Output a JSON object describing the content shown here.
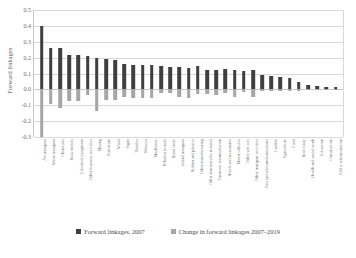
{
  "chart_data": {
    "type": "bar",
    "title": "",
    "xlabel": "",
    "ylabel": "Forward linkages",
    "ylim": [
      -0.3,
      0.5
    ],
    "yticks": [
      "0.5",
      "0.4",
      "0.3",
      "0.2",
      "0.1",
      "0.0",
      "-0.1",
      "-0.2",
      "-0.3"
    ],
    "ytick_values": [
      0.5,
      0.4,
      0.3,
      0.2,
      0.1,
      0.0,
      -0.1,
      -0.2,
      -0.3
    ],
    "grid": true,
    "legend_position": "bottom",
    "categories": [
      "Air transport",
      "Water transport",
      "Chemicals",
      "Basic metals",
      "Electrical equipment",
      "Other business activities",
      "Mining",
      "Petroleum",
      "Wood",
      "Paper",
      "Textiles",
      "Tobacco",
      "Machinery",
      "Wholesale trade",
      "Retail trade",
      "Inland transport",
      "Rubber and plastics",
      "Other manufacturing",
      "Other non-metallic mineral",
      "Financial intermediation",
      "Hotels and restaurants",
      "Motor vehicles",
      "Other services",
      "Other transport activities",
      "Post and telecommunications",
      "Leather",
      "Agriculture",
      "Food",
      "Real estate",
      "Health and social work",
      "Education",
      "Construction",
      "Public administration"
    ],
    "series": [
      {
        "name": "Forward linkages, 2007",
        "color": "#3f3f3f",
        "values": [
          0.4,
          0.26,
          0.26,
          0.215,
          0.215,
          0.21,
          0.195,
          0.19,
          0.185,
          0.16,
          0.155,
          0.155,
          0.155,
          0.15,
          0.14,
          0.14,
          0.135,
          0.15,
          0.125,
          0.125,
          0.13,
          0.125,
          0.115,
          0.12,
          0.09,
          0.085,
          0.08,
          0.07,
          0.045,
          0.03,
          0.02,
          0.015,
          0.012
        ]
      },
      {
        "name": "Change in forward linkages 2007–2019",
        "color": "#a6a6a6",
        "values": [
          -0.3,
          -0.09,
          -0.115,
          -0.075,
          -0.075,
          -0.035,
          -0.135,
          -0.065,
          -0.07,
          -0.045,
          -0.055,
          -0.055,
          -0.055,
          -0.025,
          -0.025,
          -0.045,
          -0.055,
          -0.03,
          -0.03,
          -0.035,
          -0.02,
          -0.045,
          -0.015,
          -0.045,
          -0.012,
          -0.012,
          -0.012,
          -0.01,
          -0.008,
          -0.005,
          -0.004,
          -0.003,
          -0.002
        ]
      }
    ]
  },
  "legend": [
    {
      "label": "Forward linkages, 2007",
      "color": "#3f3f3f"
    },
    {
      "label": "Change in forward linkages 2007–2019",
      "color": "#a6a6a6"
    }
  ]
}
